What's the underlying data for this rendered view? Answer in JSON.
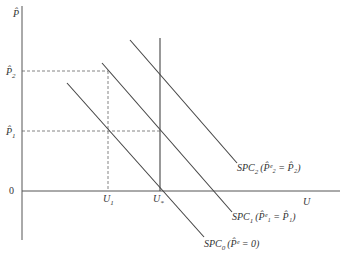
{
  "diagram": {
    "type": "phillips-curve",
    "y_axis_label": "P̂",
    "x_axis_label": "U",
    "origin_label": "0",
    "y_ticks": [
      {
        "id": "p2",
        "base": "P̂",
        "sub": "2"
      },
      {
        "id": "p1",
        "base": "P̂",
        "sub": "1"
      }
    ],
    "x_ticks": [
      {
        "id": "u1",
        "base": "U",
        "sub": "1"
      },
      {
        "id": "ustar",
        "base": "U",
        "sub": "*"
      }
    ],
    "curves": [
      {
        "id": "spc0",
        "name": "SPC",
        "sub": "0",
        "condition": "(P̂ᵉ = 0)"
      },
      {
        "id": "spc1",
        "name": "SPC",
        "sub": "1",
        "condition": "(P̂ᵉ₁ = P̂₁)"
      },
      {
        "id": "spc2",
        "name": "SPC",
        "sub": "2",
        "condition": "(P̂ᵉ₂ = P̂₂)"
      }
    ],
    "natural_rate_line": "vertical line at U*"
  }
}
